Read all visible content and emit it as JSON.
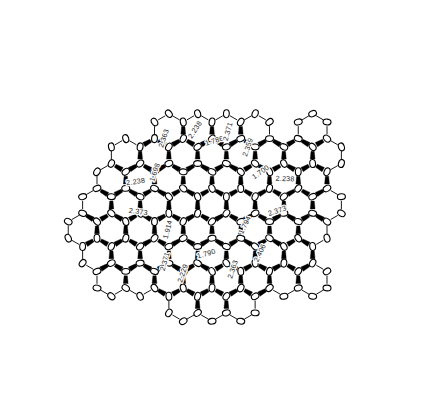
{
  "figure": {
    "type": "molecular-structure-diagram",
    "page_header_artifact": "",
    "units": "Angstrom",
    "background_color": "#ffffff",
    "bond_color": "#000000",
    "atom_fill_color": "#ffffff",
    "atom_outline_color": "#000000",
    "label_color": "#262626"
  },
  "labels": [
    {
      "id": "d01",
      "value": "2.238",
      "x": 197,
      "y": 131,
      "rotate": -56
    },
    {
      "id": "d02",
      "value": "2.363",
      "x": 166,
      "y": 139,
      "rotate": -72
    },
    {
      "id": "d03",
      "value": "1.786",
      "x": 215,
      "y": 143,
      "rotate": -17
    },
    {
      "id": "d04",
      "value": "2.371",
      "x": 230,
      "y": 132,
      "rotate": -74
    },
    {
      "id": "d05",
      "value": "2.359",
      "x": 250,
      "y": 148,
      "rotate": -70
    },
    {
      "id": "d06",
      "value": "1.700",
      "x": 262,
      "y": 174,
      "rotate": -36
    },
    {
      "id": "d07",
      "value": "2.238",
      "x": 285,
      "y": 181,
      "rotate": 2
    },
    {
      "id": "d08",
      "value": "1.698",
      "x": 157,
      "y": 173,
      "rotate": -72
    },
    {
      "id": "d09",
      "value": "2.238",
      "x": 136,
      "y": 184,
      "rotate": -8
    },
    {
      "id": "d10",
      "value": "2.373",
      "x": 138,
      "y": 214,
      "rotate": 8
    },
    {
      "id": "d11",
      "value": "1.914",
      "x": 170,
      "y": 230,
      "rotate": -75
    },
    {
      "id": "d12",
      "value": "2.371",
      "x": 167,
      "y": 262,
      "rotate": -74
    },
    {
      "id": "d13",
      "value": "2.229",
      "x": 185,
      "y": 274,
      "rotate": -72
    },
    {
      "id": "d14",
      "value": "1.790",
      "x": 207,
      "y": 256,
      "rotate": -16
    },
    {
      "id": "d15",
      "value": "1.794",
      "x": 247,
      "y": 226,
      "rotate": -64
    },
    {
      "id": "d16",
      "value": "2.373",
      "x": 278,
      "y": 213,
      "rotate": -18
    },
    {
      "id": "d17",
      "value": "2.406",
      "x": 262,
      "y": 254,
      "rotate": -65
    },
    {
      "id": "d18",
      "value": "2.363",
      "x": 235,
      "y": 270,
      "rotate": -72
    }
  ],
  "legend": {
    "atom_label": "carbon atom (thermal ellipsoid)",
    "bond_label": "covalent bond",
    "distance_label": "interatomic distance"
  }
}
